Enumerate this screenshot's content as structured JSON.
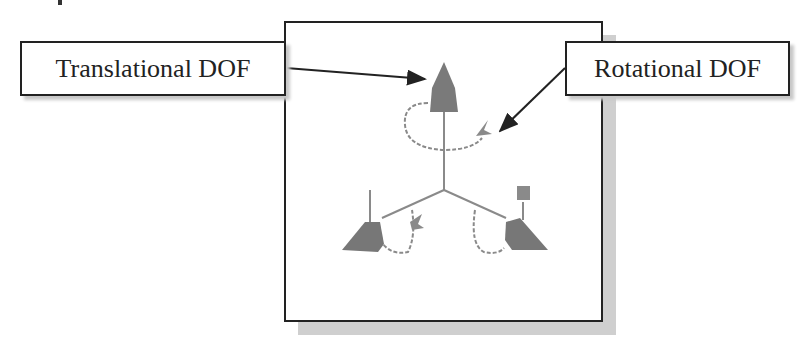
{
  "labels": {
    "translational": "Translational DOF",
    "rotational": "Rotational DOF"
  },
  "figure": {
    "colors": {
      "triad_gray": "#7a7a7a",
      "line": "#222222",
      "shadow": "#cfcfcf"
    },
    "icons": [
      "translational-cone-icon",
      "rotational-arc-icon"
    ]
  }
}
